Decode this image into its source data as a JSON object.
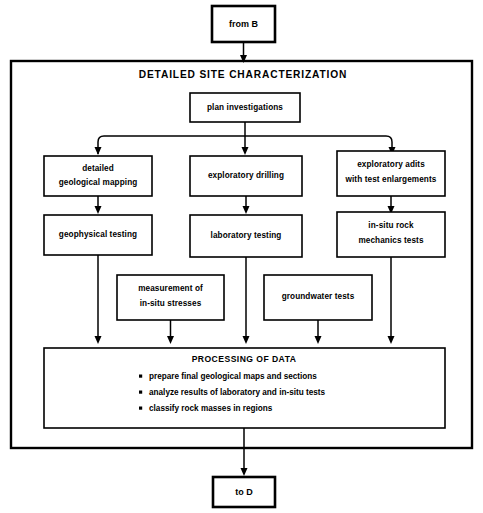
{
  "diagram": {
    "title": "DETAILED SITE CHARACTERIZATION",
    "entry_terminal": "from B",
    "exit_terminal": "to D",
    "nodes": {
      "plan": "plan investigations",
      "mapping_line1": "detailed",
      "mapping_line2": "geological mapping",
      "drilling": "exploratory drilling",
      "adits_line1": "exploratory adits",
      "adits_line2": "with test enlargements",
      "geophysical": "geophysical testing",
      "laboratory": "laboratory testing",
      "insitu_rock_line1": "in-situ rock",
      "insitu_rock_line2": "mechanics tests",
      "stresses_line1": "measurement of",
      "stresses_line2": "in-situ stresses",
      "groundwater": "groundwater tests"
    },
    "processing": {
      "title": "PROCESSING OF DATA",
      "items": [
        "prepare final geological maps and sections",
        "analyze results of laboratory and in-situ tests",
        "classify rock masses in regions"
      ]
    },
    "colors": {
      "background": "#ffffff",
      "stroke": "#000000",
      "text": "#000000"
    }
  }
}
